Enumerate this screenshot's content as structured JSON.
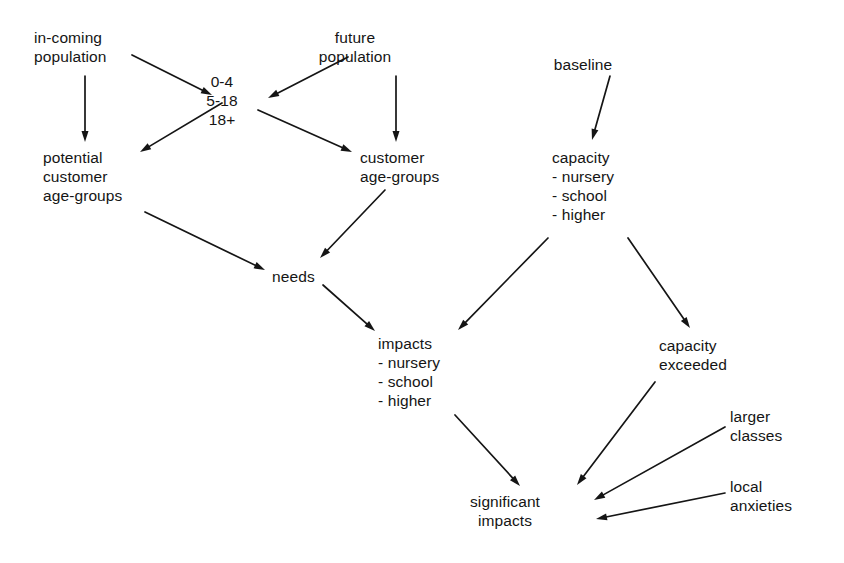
{
  "diagram": {
    "background_color": "#ffffff",
    "ink_color": "#151515",
    "nodes": [
      {
        "id": "in-coming-population",
        "label": "in-coming population",
        "lines": [
          "in-coming",
          "population"
        ],
        "x": 34,
        "y": 28,
        "align": "left"
      },
      {
        "id": "future-population",
        "label": "future population",
        "lines": [
          "future",
          "population"
        ],
        "x": 355,
        "y": 28,
        "align": "center"
      },
      {
        "id": "baseline",
        "label": "baseline",
        "lines": [
          "baseline"
        ],
        "x": 583,
        "y": 55,
        "align": "center"
      },
      {
        "id": "age-bands",
        "label": "0-4 5-18 18+",
        "lines": [
          "0-4",
          "5-18",
          "18+"
        ],
        "x": 222,
        "y": 72,
        "align": "center"
      },
      {
        "id": "potential-customer-age-groups",
        "label": "potential customer age-groups",
        "lines": [
          "potential",
          "customer",
          "age-groups"
        ],
        "x": 43,
        "y": 148,
        "align": "left"
      },
      {
        "id": "customer-age-groups",
        "label": "customer age-groups",
        "lines": [
          "customer",
          "age-groups"
        ],
        "x": 360,
        "y": 148,
        "align": "left"
      },
      {
        "id": "capacity",
        "label": "capacity - nursery - school - higher",
        "lines": [
          "capacity",
          "- nursery",
          "- school",
          "- higher"
        ],
        "x": 552,
        "y": 148,
        "align": "left"
      },
      {
        "id": "needs",
        "label": "needs",
        "lines": [
          "needs"
        ],
        "x": 272,
        "y": 267,
        "align": "left"
      },
      {
        "id": "impacts",
        "label": "impacts - nursery - school - higher",
        "lines": [
          "impacts",
          "- nursery",
          "- school",
          "- higher"
        ],
        "x": 378,
        "y": 334,
        "align": "left"
      },
      {
        "id": "capacity-exceeded",
        "label": "capacity exceeded",
        "lines": [
          "capacity",
          "exceeded"
        ],
        "x": 659,
        "y": 336,
        "align": "left"
      },
      {
        "id": "larger-classes",
        "label": "larger classes",
        "lines": [
          "larger",
          "classes"
        ],
        "x": 730,
        "y": 407,
        "align": "left"
      },
      {
        "id": "local-anxieties",
        "label": "local anxieties",
        "lines": [
          "local",
          "anxieties"
        ],
        "x": 730,
        "y": 477,
        "align": "left"
      },
      {
        "id": "significant-impacts",
        "label": "significant impacts",
        "lines": [
          "significant",
          "impacts"
        ],
        "x": 505,
        "y": 492,
        "align": "center"
      }
    ],
    "edges": [
      {
        "id": "edge-incoming-to-agebands",
        "from": "in-coming-population",
        "to": "age-bands",
        "x1": 132,
        "y1": 55,
        "x2": 212,
        "y2": 95
      },
      {
        "id": "edge-incoming-to-potential",
        "from": "in-coming-population",
        "to": "potential-customer-age-groups",
        "x1": 85,
        "y1": 76,
        "x2": 85,
        "y2": 142
      },
      {
        "id": "edge-future-to-agebands",
        "from": "future-population",
        "to": "age-bands",
        "x1": 348,
        "y1": 57,
        "x2": 268,
        "y2": 98
      },
      {
        "id": "edge-future-to-customer",
        "from": "future-population",
        "to": "customer-age-groups",
        "x1": 396,
        "y1": 76,
        "x2": 396,
        "y2": 142
      },
      {
        "id": "edge-agebands-to-potential",
        "from": "age-bands",
        "to": "potential-customer-age-groups",
        "x1": 222,
        "y1": 103,
        "x2": 140,
        "y2": 152
      },
      {
        "id": "edge-agebands-to-customer",
        "from": "age-bands",
        "to": "customer-age-groups",
        "x1": 258,
        "y1": 110,
        "x2": 352,
        "y2": 152
      },
      {
        "id": "edge-baseline-to-capacity",
        "from": "baseline",
        "to": "capacity",
        "x1": 610,
        "y1": 76,
        "x2": 592,
        "y2": 140
      },
      {
        "id": "edge-potential-to-needs",
        "from": "potential-customer-age-groups",
        "to": "needs",
        "x1": 145,
        "y1": 212,
        "x2": 265,
        "y2": 270
      },
      {
        "id": "edge-customer-to-needs",
        "from": "customer-age-groups",
        "to": "needs",
        "x1": 385,
        "y1": 190,
        "x2": 320,
        "y2": 258
      },
      {
        "id": "edge-needs-to-impacts",
        "from": "needs",
        "to": "impacts",
        "x1": 323,
        "y1": 285,
        "x2": 375,
        "y2": 331
      },
      {
        "id": "edge-capacity-to-impacts",
        "from": "capacity",
        "to": "impacts",
        "x1": 548,
        "y1": 238,
        "x2": 458,
        "y2": 330
      },
      {
        "id": "edge-capacity-to-exceeded",
        "from": "capacity",
        "to": "capacity-exceeded",
        "x1": 628,
        "y1": 238,
        "x2": 690,
        "y2": 328
      },
      {
        "id": "edge-impacts-to-significant",
        "from": "impacts",
        "to": "significant-impacts",
        "x1": 455,
        "y1": 415,
        "x2": 520,
        "y2": 486
      },
      {
        "id": "edge-exceeded-to-significant",
        "from": "capacity-exceeded",
        "to": "significant-impacts",
        "x1": 655,
        "y1": 382,
        "x2": 577,
        "y2": 485
      },
      {
        "id": "edge-larger-to-significant",
        "from": "larger-classes",
        "to": "significant-impacts",
        "x1": 725,
        "y1": 427,
        "x2": 594,
        "y2": 500
      },
      {
        "id": "edge-anxieties-to-significant",
        "from": "local-anxieties",
        "to": "significant-impacts",
        "x1": 725,
        "y1": 493,
        "x2": 596,
        "y2": 519
      }
    ]
  }
}
